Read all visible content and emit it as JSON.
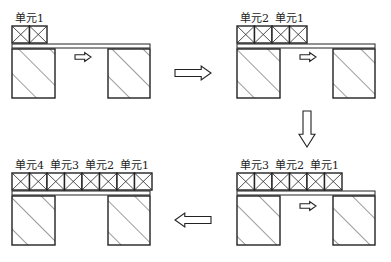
{
  "colors": {
    "stroke": "#222222",
    "fill": "#ffffff"
  },
  "panels": [
    {
      "id": "stage-1",
      "labels": [
        "单元1"
      ],
      "cells": 2
    },
    {
      "id": "stage-2",
      "labels": [
        "单元2",
        "单元1"
      ],
      "cells": 4
    },
    {
      "id": "stage-3",
      "labels": [
        "单元3",
        "单元2",
        "单元1"
      ],
      "cells": 6
    },
    {
      "id": "stage-4",
      "labels": [
        "单元4",
        "单元3",
        "单元2",
        "单元1"
      ],
      "cells": 8
    }
  ],
  "arrows": [
    {
      "id": "push-arrow-stage-1",
      "direction": "right"
    },
    {
      "id": "push-arrow-stage-2",
      "direction": "right"
    },
    {
      "id": "push-arrow-stage-3",
      "direction": "right"
    },
    {
      "id": "flow-arrow-1-to-2",
      "direction": "right"
    },
    {
      "id": "flow-arrow-2-to-3",
      "direction": "down"
    },
    {
      "id": "flow-arrow-3-to-4",
      "direction": "left"
    }
  ]
}
